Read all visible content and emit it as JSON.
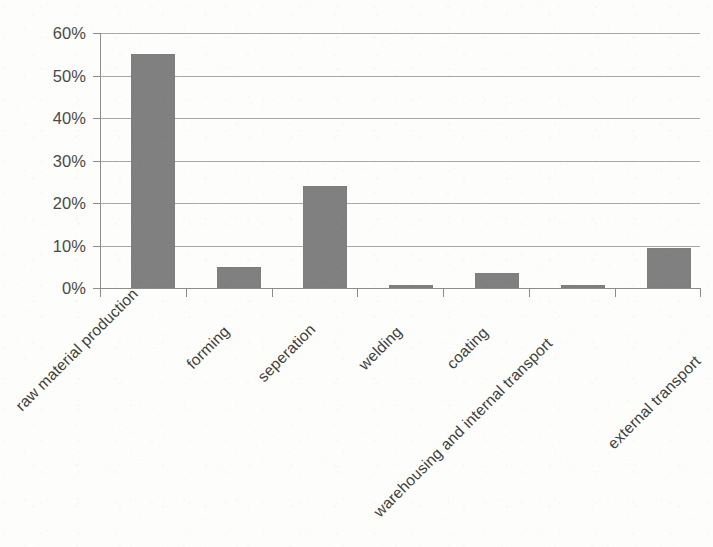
{
  "chart_data": {
    "type": "bar",
    "title": "",
    "subtitle": "",
    "xlabel": "",
    "ylabel": "",
    "categories": [
      "raw material production",
      "forming",
      "seperation",
      "welding",
      "coating",
      "warehousing and internal transport",
      "external transport"
    ],
    "values": [
      55,
      5,
      24,
      0.7,
      3.5,
      0.6,
      9.5
    ],
    "value_labels": [
      "55%",
      "5%",
      "24%",
      "0.7%",
      "3.5%",
      "0.6%",
      "9.5%"
    ],
    "ylim": [
      0,
      60
    ],
    "ytick_values": [
      0,
      10,
      20,
      30,
      40,
      50,
      60
    ],
    "ytick_labels": [
      "0%",
      "10%",
      "20%",
      "30%",
      "40%",
      "50%",
      "60%"
    ],
    "grid": true,
    "grid_axis": "y",
    "legend": false,
    "legend_position": "none",
    "bar_color": "#808080",
    "grid_color": "#9a9a98",
    "axis_color": "#8c8c8a",
    "text_color": "#4a4a48",
    "background_color": "#fdfdfc",
    "xtick_label_rotation": -45
  }
}
